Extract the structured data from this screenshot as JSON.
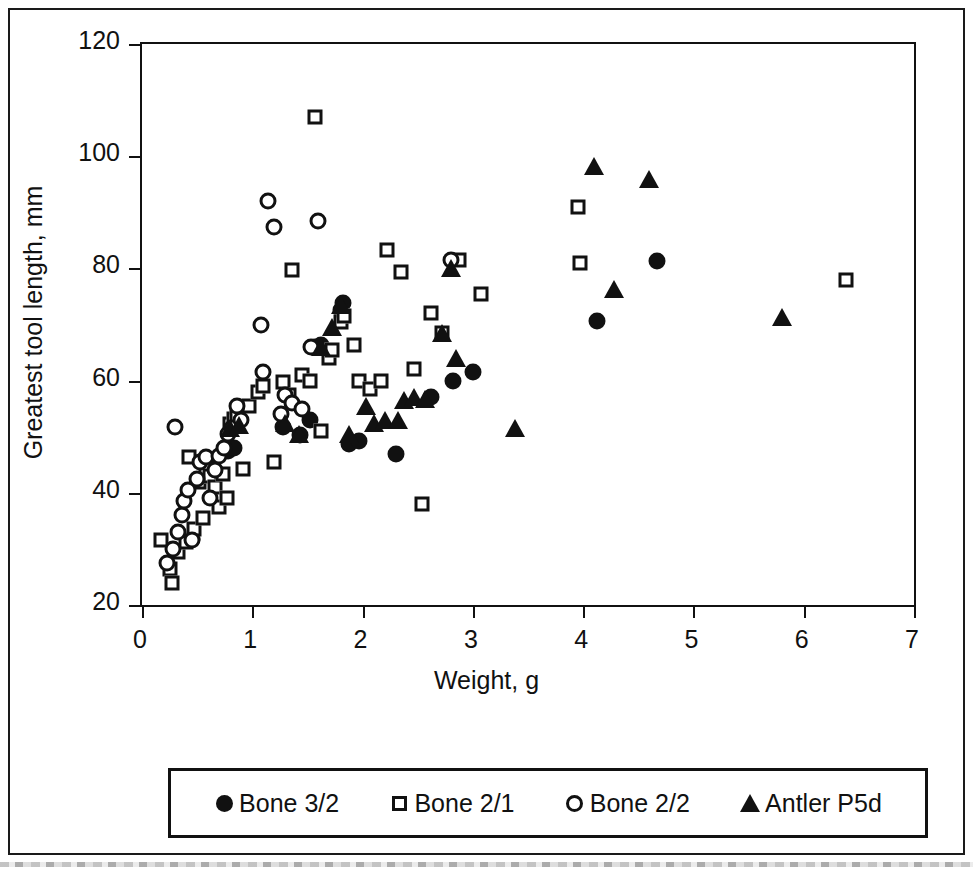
{
  "chart_data": {
    "type": "scatter",
    "title": "",
    "xlabel": "Weight, g",
    "ylabel": "Greatest tool length, mm",
    "xlim": [
      0,
      7
    ],
    "ylim": [
      20,
      120
    ],
    "xticks": [
      0,
      1,
      2,
      3,
      4,
      5,
      6,
      7
    ],
    "xtick_labels": [
      "0",
      "1",
      "2",
      "3",
      "4",
      "5",
      "6",
      "7"
    ],
    "yticks": [
      20,
      40,
      60,
      80,
      100,
      120
    ],
    "ytick_labels": [
      "20",
      "40",
      "60",
      "80",
      "100",
      "120"
    ],
    "grid": false,
    "legend_position": "below-plot",
    "series": [
      {
        "name": "Bone 3/2",
        "marker": "filled-circle",
        "color": "#111111",
        "points": [
          [
            0.45,
            31.7
          ],
          [
            0.62,
            44.0
          ],
          [
            0.78,
            47.4
          ],
          [
            0.83,
            47.9
          ],
          [
            1.28,
            51.8
          ],
          [
            1.43,
            50.3
          ],
          [
            1.52,
            53.0
          ],
          [
            1.57,
            66.0
          ],
          [
            1.62,
            66.3
          ],
          [
            1.8,
            72.5
          ],
          [
            1.82,
            73.8
          ],
          [
            1.88,
            48.7
          ],
          [
            1.97,
            49.3
          ],
          [
            2.3,
            47.0
          ],
          [
            2.62,
            57.0
          ],
          [
            2.82,
            60.0
          ],
          [
            3.0,
            61.5
          ],
          [
            4.13,
            70.7
          ],
          [
            4.67,
            81.3
          ]
        ]
      },
      {
        "name": "Bone 2/1",
        "marker": "open-square",
        "color": "#111111",
        "points": [
          [
            0.17,
            31.6
          ],
          [
            0.25,
            26.5
          ],
          [
            0.27,
            24.0
          ],
          [
            0.33,
            29.5
          ],
          [
            0.4,
            31.3
          ],
          [
            0.43,
            46.3
          ],
          [
            0.47,
            33.5
          ],
          [
            0.52,
            42.0
          ],
          [
            0.55,
            35.5
          ],
          [
            0.58,
            44.5
          ],
          [
            0.62,
            43.0
          ],
          [
            0.66,
            41.0
          ],
          [
            0.7,
            37.5
          ],
          [
            0.73,
            43.3
          ],
          [
            0.77,
            39.0
          ],
          [
            0.8,
            52.2
          ],
          [
            0.83,
            53.2
          ],
          [
            0.86,
            53.5
          ],
          [
            0.92,
            44.3
          ],
          [
            0.97,
            55.5
          ],
          [
            1.05,
            58.0
          ],
          [
            1.1,
            59.0
          ],
          [
            1.2,
            45.5
          ],
          [
            1.28,
            59.8
          ],
          [
            1.33,
            57.5
          ],
          [
            1.36,
            79.8
          ],
          [
            1.45,
            61.0
          ],
          [
            1.52,
            60.0
          ],
          [
            1.57,
            107.0
          ],
          [
            1.62,
            51.0
          ],
          [
            1.7,
            64.0
          ],
          [
            1.72,
            65.5
          ],
          [
            1.8,
            70.5
          ],
          [
            1.83,
            71.5
          ],
          [
            1.92,
            66.3
          ],
          [
            1.97,
            60.0
          ],
          [
            2.07,
            58.5
          ],
          [
            2.17,
            60.0
          ],
          [
            2.22,
            83.3
          ],
          [
            2.35,
            79.3
          ],
          [
            2.47,
            62.0
          ],
          [
            2.54,
            38.0
          ],
          [
            2.62,
            72.0
          ],
          [
            2.72,
            68.5
          ],
          [
            2.87,
            81.5
          ],
          [
            3.07,
            75.5
          ],
          [
            3.95,
            91.0
          ],
          [
            3.97,
            81.0
          ],
          [
            6.38,
            78.0
          ]
        ]
      },
      {
        "name": "Bone 2/2",
        "marker": "open-circle",
        "color": "#111111",
        "points": [
          [
            0.23,
            27.5
          ],
          [
            0.28,
            30.0
          ],
          [
            0.3,
            51.8
          ],
          [
            0.33,
            33.0
          ],
          [
            0.36,
            36.0
          ],
          [
            0.38,
            38.5
          ],
          [
            0.42,
            40.5
          ],
          [
            0.45,
            31.5
          ],
          [
            0.5,
            42.5
          ],
          [
            0.53,
            45.5
          ],
          [
            0.58,
            46.3
          ],
          [
            0.62,
            39.0
          ],
          [
            0.66,
            44.0
          ],
          [
            0.7,
            46.5
          ],
          [
            0.74,
            48.0
          ],
          [
            0.78,
            50.5
          ],
          [
            0.82,
            51.5
          ],
          [
            0.86,
            55.5
          ],
          [
            0.9,
            53.0
          ],
          [
            1.08,
            70.0
          ],
          [
            1.1,
            61.5
          ],
          [
            1.14,
            92.0
          ],
          [
            1.2,
            87.3
          ],
          [
            1.26,
            54.0
          ],
          [
            1.3,
            57.5
          ],
          [
            1.36,
            56.0
          ],
          [
            1.45,
            55.0
          ],
          [
            1.53,
            66.0
          ],
          [
            1.6,
            88.5
          ],
          [
            2.8,
            81.5
          ]
        ]
      },
      {
        "name": "Antler P5d",
        "marker": "filled-triangle",
        "color": "#111111",
        "points": [
          [
            0.8,
            51.5
          ],
          [
            0.88,
            52.0
          ],
          [
            1.3,
            52.5
          ],
          [
            1.42,
            50.5
          ],
          [
            1.62,
            66.0
          ],
          [
            1.72,
            69.5
          ],
          [
            1.8,
            73.5
          ],
          [
            1.88,
            50.5
          ],
          [
            2.03,
            55.5
          ],
          [
            2.1,
            52.5
          ],
          [
            2.2,
            53.0
          ],
          [
            2.32,
            53.0
          ],
          [
            2.38,
            56.5
          ],
          [
            2.47,
            57.0
          ],
          [
            2.57,
            56.8
          ],
          [
            2.72,
            68.5
          ],
          [
            2.8,
            80.0
          ],
          [
            2.85,
            64.0
          ],
          [
            3.38,
            51.5
          ],
          [
            4.1,
            98.3
          ],
          [
            4.28,
            76.3
          ],
          [
            4.6,
            96.0
          ],
          [
            5.8,
            71.3
          ]
        ]
      }
    ]
  },
  "legend": {
    "entries": [
      {
        "label": "Bone 3/2",
        "marker": "filled-circle"
      },
      {
        "label": "Bone 2/1",
        "marker": "open-square"
      },
      {
        "label": "Bone 2/2",
        "marker": "open-circle"
      },
      {
        "label": "Antler P5d",
        "marker": "filled-triangle"
      }
    ]
  }
}
